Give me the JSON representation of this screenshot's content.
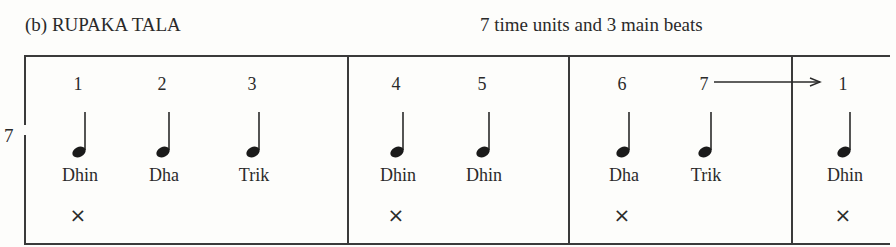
{
  "header": {
    "title": "(b) RUPAKA TALA",
    "subtitle": "7  time units and 3 main beats"
  },
  "cycle_length_label": "7",
  "sections": [
    {
      "beats": [
        {
          "number": "1",
          "syllable": "Dhin",
          "clap": "×"
        },
        {
          "number": "2",
          "syllable": "Dha",
          "clap": ""
        },
        {
          "number": "3",
          "syllable": "Trik",
          "clap": ""
        }
      ]
    },
    {
      "beats": [
        {
          "number": "4",
          "syllable": "Dhin",
          "clap": "×"
        },
        {
          "number": "5",
          "syllable": "Dhin",
          "clap": ""
        }
      ]
    },
    {
      "beats": [
        {
          "number": "6",
          "syllable": "Dha",
          "clap": "×"
        },
        {
          "number": "7",
          "syllable": "Trik",
          "clap": ""
        }
      ]
    },
    {
      "beats": [
        {
          "number": "1",
          "syllable": "Dhin",
          "clap": "×"
        }
      ]
    }
  ],
  "colors": {
    "ink": "#2a2a2a",
    "paper": "#fdfdfb"
  }
}
